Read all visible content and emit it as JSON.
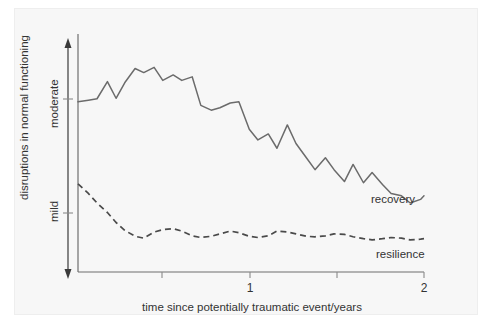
{
  "chart_data": {
    "type": "line",
    "title": "",
    "xlabel": "time since potentially traumatic event/years",
    "ylabel": "disruptions in normal functioning",
    "xlim": [
      0,
      2
    ],
    "ylim": [
      0,
      1
    ],
    "grid": false,
    "legend_position": "inline-right",
    "xticks": [
      0.5,
      1,
      1.5,
      2
    ],
    "xticklabels": [
      "",
      "1",
      "",
      "2"
    ],
    "yticklabels": [
      "moderate",
      "mild"
    ],
    "ylevel_moderate": 0.72,
    "ylevel_mild": 0.35,
    "annotations": [
      {
        "text": "recovery",
        "x": 1.72,
        "y": 0.33
      },
      {
        "text": "resilience",
        "x": 1.78,
        "y": 0.14
      }
    ],
    "series": [
      {
        "name": "recovery",
        "style": "solid",
        "color": "#6b6b6b",
        "x": [
          0.0,
          0.06,
          0.11,
          0.17,
          0.22,
          0.27,
          0.33,
          0.38,
          0.44,
          0.49,
          0.55,
          0.6,
          0.66,
          0.71,
          0.77,
          0.82,
          0.88,
          0.93,
          0.99,
          1.04,
          1.1,
          1.15,
          1.21,
          1.26,
          1.32,
          1.37,
          1.43,
          1.48,
          1.54,
          1.59,
          1.65,
          1.7,
          1.76,
          1.81,
          1.87,
          1.92,
          1.98,
          2.0
        ],
        "y": [
          0.715,
          0.722,
          0.728,
          0.8,
          0.73,
          0.795,
          0.855,
          0.838,
          0.86,
          0.805,
          0.828,
          0.805,
          0.82,
          0.7,
          0.68,
          0.69,
          0.71,
          0.715,
          0.6,
          0.555,
          0.58,
          0.52,
          0.618,
          0.54,
          0.48,
          0.43,
          0.48,
          0.43,
          0.38,
          0.452,
          0.375,
          0.418,
          0.368,
          0.33,
          0.32,
          0.29,
          0.305,
          0.32
        ]
      },
      {
        "name": "resilience",
        "style": "dashed",
        "color": "#4a4a4a",
        "x": [
          0.0,
          0.06,
          0.11,
          0.17,
          0.22,
          0.27,
          0.33,
          0.38,
          0.44,
          0.49,
          0.55,
          0.6,
          0.66,
          0.71,
          0.77,
          0.82,
          0.88,
          0.93,
          0.99,
          1.04,
          1.1,
          1.15,
          1.21,
          1.26,
          1.32,
          1.37,
          1.43,
          1.48,
          1.54,
          1.59,
          1.65,
          1.7,
          1.76,
          1.81,
          1.87,
          1.92,
          1.98,
          2.0
        ],
        "y": [
          0.37,
          0.33,
          0.29,
          0.25,
          0.208,
          0.175,
          0.15,
          0.142,
          0.168,
          0.178,
          0.182,
          0.172,
          0.152,
          0.145,
          0.15,
          0.16,
          0.172,
          0.165,
          0.15,
          0.145,
          0.152,
          0.172,
          0.168,
          0.16,
          0.15,
          0.148,
          0.152,
          0.16,
          0.158,
          0.148,
          0.14,
          0.135,
          0.14,
          0.145,
          0.142,
          0.135,
          0.138,
          0.14
        ]
      }
    ]
  },
  "axis": {
    "y_title": "disruptions in normal functioning",
    "y_label_moderate": "moderate",
    "y_label_mild": "mild",
    "x_title": "time since potentially traumatic event/years",
    "x_tick_1": "1",
    "x_tick_2": "2"
  },
  "series_labels": {
    "recovery": "recovery",
    "resilience": "resilience"
  }
}
